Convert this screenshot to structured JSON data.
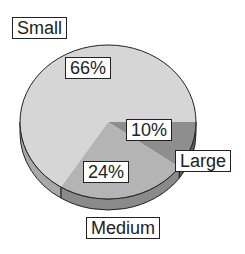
{
  "chart_data": {
    "type": "pie",
    "title": "",
    "style": "3d",
    "slices": [
      {
        "label": "Small",
        "value": 66,
        "value_label": "66%",
        "color": "#d6d6d6",
        "side_color": "#a8a8a8"
      },
      {
        "label": "Medium",
        "value": 24,
        "value_label": "24%",
        "color": "#b4b4b4",
        "side_color": "#8a8a8a"
      },
      {
        "label": "Large",
        "value": 10,
        "value_label": "10%",
        "color": "#8e8e8e",
        "side_color": "#5e5e5e"
      }
    ]
  }
}
